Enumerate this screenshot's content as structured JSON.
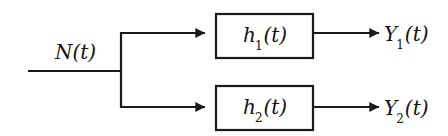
{
  "figure": {
    "type": "block-diagram",
    "title": "",
    "background_color": "#ffffff",
    "line_color": "#1a1a1a"
  },
  "nodes": {
    "input": {
      "label_base": "N",
      "label_arg": "(t)",
      "label_full": "N(t)",
      "subscript": ""
    },
    "branch": {
      "label": "",
      "name": "branch-node"
    },
    "block_1": {
      "label_base": "h",
      "subscript": "1",
      "label_arg": "(t)",
      "label_full": "h1(t)"
    },
    "block_2": {
      "label_base": "h",
      "subscript": "2",
      "label_arg": "(t)",
      "label_full": "h2(t)"
    },
    "output_1": {
      "label_base": "Y",
      "subscript": "1",
      "label_arg": "(t)",
      "label_full": "Y1(t)"
    },
    "output_2": {
      "label_base": "Y",
      "subscript": "2",
      "label_arg": "(t)",
      "label_full": "Y2(t)"
    }
  },
  "connections": [
    {
      "name": "input-line",
      "from": "input",
      "to": "branch",
      "arrow": false
    },
    {
      "name": "branch-to-block-1",
      "from": "branch",
      "to": "block_1",
      "arrow": true
    },
    {
      "name": "branch-to-block-2",
      "from": "branch",
      "to": "block_2",
      "arrow": true
    },
    {
      "name": "block-1-to-output-1",
      "from": "block_1",
      "to": "output_1",
      "arrow": true
    },
    {
      "name": "block-2-to-output-2",
      "from": "block_2",
      "to": "output_2",
      "arrow": true
    }
  ]
}
